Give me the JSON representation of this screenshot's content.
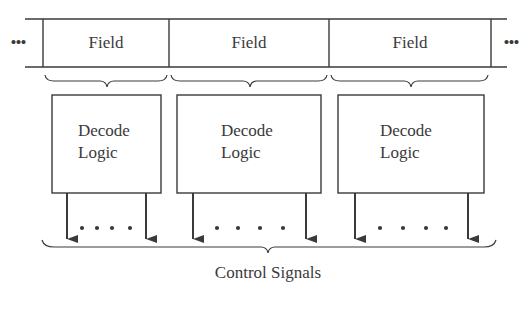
{
  "diagram": {
    "register": {
      "leading_ellipsis": "•••",
      "trailing_ellipsis": "•••",
      "fields": [
        {
          "label": "Field"
        },
        {
          "label": "Field"
        },
        {
          "label": "Field"
        }
      ]
    },
    "decoders": [
      {
        "line1": "Decode",
        "line2": "Logic",
        "dots": "•    •    •    •"
      },
      {
        "line1": "Decode",
        "line2": "Logic",
        "dots": "•    •    •    •"
      },
      {
        "line1": "Decode",
        "line2": "Logic",
        "dots": "•    •    •    •"
      }
    ],
    "output_label": "Control Signals",
    "colors": {
      "line": "#3a3a3a",
      "text": "#3a3a3a",
      "background": "#ffffff"
    }
  }
}
